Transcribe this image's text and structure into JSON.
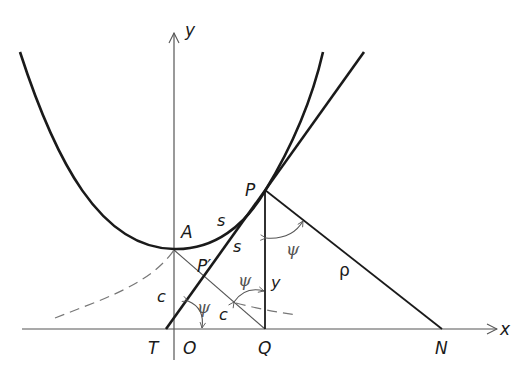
{
  "diagram": {
    "axes": {
      "x_label": "x",
      "y_label": "y"
    },
    "points": {
      "A": "A",
      "P": "P",
      "P_prime": "P′",
      "T": "T",
      "O": "O",
      "Q": "Q",
      "N": "N"
    },
    "segment_labels": {
      "arc_AP": "s",
      "tangent_PPprime": "s",
      "OA": "c",
      "PprimeQ": "c",
      "PQ": "y",
      "PN": "ρ"
    },
    "angles": {
      "at_T": "ψ",
      "at_Pprime_Q": "ψ",
      "at_P": "ψ"
    },
    "colors": {
      "curve": "#1a1a1a",
      "thin_line": "#555555",
      "dashed": "#777777",
      "background": "#ffffff"
    }
  }
}
